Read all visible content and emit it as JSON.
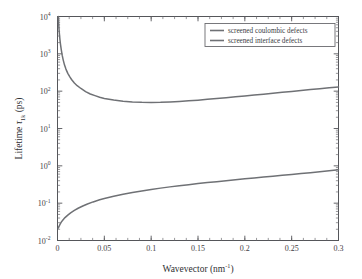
{
  "chart_data": {
    "type": "line",
    "title": "",
    "xlabel": "Wavevector (nm⁻¹)",
    "ylabel": "Lifetime τ₁ₖ (ps)",
    "xlabel_parts": {
      "text": "Wavevector (nm",
      "sup": "-1",
      "tail": ")"
    },
    "ylabel_parts": {
      "head": "Lifetime ",
      "tau": "τ",
      "sub": "1k",
      "tail": " (ps)"
    },
    "xscale": "linear",
    "yscale": "log",
    "xlim": [
      0,
      0.3
    ],
    "ylim": [
      0.01,
      10000
    ],
    "grid": false,
    "legend_position": "upper right",
    "xticks": [
      0,
      0.05,
      0.1,
      0.15,
      0.2,
      0.25,
      0.3
    ],
    "xticklabels": [
      "0",
      "0.05",
      "0.1",
      "0.15",
      "0.2",
      "0.25",
      "0.3"
    ],
    "yticks": [
      0.01,
      0.1,
      1,
      10,
      100,
      1000,
      10000
    ],
    "yticklabels": [
      "10-2",
      "10-1",
      "100",
      "101",
      "102",
      "103",
      "104"
    ],
    "ytick_mantissa": "10",
    "ytick_exponents": [
      "-2",
      "-1",
      "0",
      "1",
      "2",
      "3",
      "4"
    ],
    "line_color": "#6f7175",
    "axis_color": "#55565a",
    "series": [
      {
        "name": "screened coulombic defects",
        "color": "#6f7175",
        "x": [
          0.0008,
          0.0012,
          0.0016,
          0.002,
          0.0026,
          0.0032,
          0.004,
          0.005,
          0.006,
          0.0075,
          0.009,
          0.011,
          0.013,
          0.015,
          0.018,
          0.021,
          0.025,
          0.03,
          0.035,
          0.04,
          0.045,
          0.05,
          0.06,
          0.07,
          0.08,
          0.09,
          0.1,
          0.11,
          0.12,
          0.13,
          0.14,
          0.15,
          0.16,
          0.17,
          0.18,
          0.19,
          0.2,
          0.21,
          0.22,
          0.23,
          0.24,
          0.25,
          0.26,
          0.27,
          0.28,
          0.29,
          0.3
        ],
        "y": [
          10000,
          6800,
          4700,
          3500,
          2400,
          1800,
          1300,
          920,
          700,
          500,
          390,
          300,
          245,
          205,
          165,
          140,
          118,
          97,
          84,
          76,
          69,
          64,
          58,
          54,
          51.5,
          50.2,
          50,
          50.4,
          51.5,
          53,
          55,
          57.5,
          60.5,
          63.5,
          67,
          70.5,
          74.5,
          78.5,
          83,
          88,
          93,
          98,
          104,
          110,
          116,
          123,
          130
        ]
      },
      {
        "name": "screened interface defects",
        "color": "#6f7175",
        "x": [
          0.0008,
          0.0015,
          0.0025,
          0.004,
          0.006,
          0.008,
          0.011,
          0.014,
          0.018,
          0.022,
          0.027,
          0.032,
          0.038,
          0.045,
          0.05,
          0.06,
          0.07,
          0.08,
          0.09,
          0.1,
          0.11,
          0.12,
          0.13,
          0.14,
          0.15,
          0.16,
          0.17,
          0.18,
          0.19,
          0.2,
          0.21,
          0.22,
          0.23,
          0.24,
          0.25,
          0.26,
          0.27,
          0.28,
          0.29,
          0.3
        ],
        "y": [
          0.0215,
          0.0235,
          0.0265,
          0.031,
          0.036,
          0.041,
          0.048,
          0.055,
          0.064,
          0.073,
          0.084,
          0.095,
          0.108,
          0.123,
          0.133,
          0.153,
          0.173,
          0.193,
          0.213,
          0.233,
          0.253,
          0.273,
          0.293,
          0.313,
          0.334,
          0.355,
          0.377,
          0.4,
          0.424,
          0.448,
          0.473,
          0.5,
          0.528,
          0.557,
          0.587,
          0.62,
          0.655,
          0.692,
          0.735,
          0.79
        ]
      }
    ],
    "legend": [
      {
        "label": "screened coulombic defects",
        "color": "#6f7175"
      },
      {
        "label": "screened interface defects",
        "color": "#6f7175"
      }
    ]
  }
}
